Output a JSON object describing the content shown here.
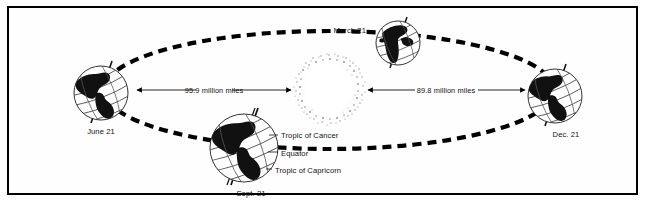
{
  "diagram": {
    "frame": {
      "border_color": "#000000",
      "background": "#ffffff"
    },
    "sun": {
      "name": "sun",
      "cx": 329,
      "cy": 89,
      "rx": 26,
      "ry": 30,
      "stipple_color": "#9a9a9a"
    },
    "orbit": {
      "name": "orbit-ellipse",
      "cx": 329,
      "cy": 90,
      "rx": 225,
      "ry": 59,
      "style": "dashed",
      "color": "#000000",
      "dash": "9 6",
      "width": 4
    },
    "earth_positions": [
      {
        "id": "june",
        "label": "June 21",
        "cx": 101,
        "cy": 93,
        "r": 27,
        "label_x": 101,
        "label_y": 131,
        "continents": "americas",
        "tilt_deg": -23.5
      },
      {
        "id": "march",
        "label": "March 21",
        "cx": 398,
        "cy": 43,
        "r": 22,
        "label_x": 364,
        "label_y": 31,
        "label_anchor": "end",
        "continents": "africa",
        "tilt_deg": -23.5
      },
      {
        "id": "december",
        "label": "Dec. 21",
        "cx": 555,
        "cy": 96,
        "r": 27,
        "label_x": 563,
        "label_y": 133,
        "continents": "americas",
        "tilt_deg": -23.5
      },
      {
        "id": "september",
        "label": "Sept. 21",
        "cx": 244,
        "cy": 148,
        "r": 34,
        "label_x": 249,
        "label_y": 193,
        "continents": "americas",
        "tilt_deg": -23.5
      }
    ],
    "distances": [
      {
        "id": "left-distance",
        "text": "95.9 million miles",
        "from_x": 131,
        "to_x": 297,
        "y": 90,
        "text_x": 214,
        "text_y": 88,
        "arrow_left": true,
        "arrow_right": true
      },
      {
        "id": "right-distance",
        "text": "89.8 million miles",
        "from_x": 363,
        "to_x": 527,
        "y": 90,
        "text_x": 445,
        "text_y": 88,
        "arrow_left": true,
        "arrow_right": true
      }
    ],
    "zone_labels": [
      {
        "id": "tropic-of-cancer",
        "text": "Tropic of Cancer",
        "x": 281,
        "y": 137,
        "leader_to_x": 272,
        "leader_to_y": 135
      },
      {
        "id": "equator",
        "text": "Equator",
        "x": 281,
        "y": 155,
        "leader_to_x": 272,
        "leader_to_y": 152
      },
      {
        "id": "tropic-of-capricorn",
        "text": "Tropic of Capricorn",
        "x": 274,
        "y": 173,
        "leader_to_x": 268,
        "leader_to_y": 169
      }
    ],
    "colors": {
      "ink": "#000000",
      "paper": "#ffffff",
      "land": "#111111",
      "grid_line": "#444444",
      "sun_stipple": "#8d8d8d"
    }
  }
}
